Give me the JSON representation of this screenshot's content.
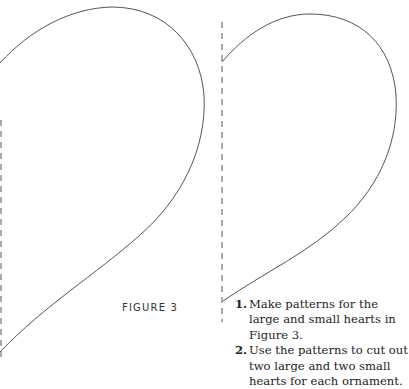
{
  "figure": {
    "label": "FIGURE 3",
    "patterns": [
      {
        "name": "large-heart-half",
        "fold_line": "dashed"
      },
      {
        "name": "small-heart-half",
        "fold_line": "dashed"
      }
    ]
  },
  "instructions": [
    {
      "number": "1.",
      "text": "Make patterns for the large and small hearts in Figure 3."
    },
    {
      "number": "2.",
      "text": "Use the patterns to cut out two large and two small hearts for each ornament."
    }
  ],
  "colors": {
    "outline": "#555555",
    "fold_line": "#555555",
    "text": "#222222"
  }
}
